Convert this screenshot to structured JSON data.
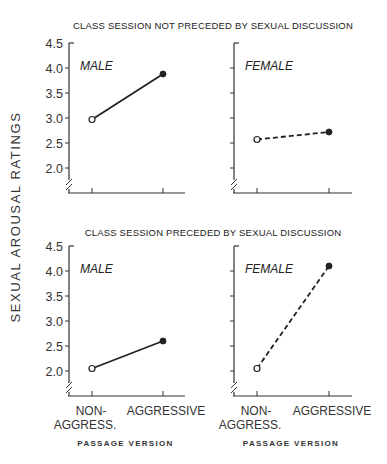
{
  "chart_data": [
    {
      "type": "line",
      "title": "CLASS SESSION NOT PRECEDED BY SEXUAL DISCUSSION",
      "panel": "MALE",
      "categories": [
        "NON-AGGRESS.",
        "AGGRESSIVE"
      ],
      "values": [
        2.97,
        3.88
      ],
      "line_style": "solid",
      "ylim": [
        2.0,
        4.5
      ],
      "yticks": [
        "4.5",
        "4.0",
        "3.5",
        "3.0",
        "2.5",
        "2.0"
      ],
      "xlabel": "",
      "ylabel": "SEXUAL AROUSAL RATINGS"
    },
    {
      "type": "line",
      "title": "CLASS SESSION NOT PRECEDED BY SEXUAL DISCUSSION",
      "panel": "FEMALE",
      "categories": [
        "NON-AGGRESS.",
        "AGGRESSIVE"
      ],
      "values": [
        2.57,
        2.72
      ],
      "line_style": "dashed",
      "ylim": [
        2.0,
        4.5
      ],
      "xlabel": "",
      "ylabel": "SEXUAL AROUSAL RATINGS"
    },
    {
      "type": "line",
      "title": "CLASS SESSION PRECEDED BY SEXUAL DISCUSSION",
      "panel": "MALE",
      "categories": [
        "NON-AGGRESS.",
        "AGGRESSIVE"
      ],
      "values": [
        2.05,
        2.6
      ],
      "line_style": "solid",
      "ylim": [
        2.0,
        4.5
      ],
      "yticks": [
        "4.5",
        "4.0",
        "3.5",
        "3.0",
        "2.5",
        "2.0"
      ],
      "xlabel": "PASSAGE VERSION",
      "ylabel": "SEXUAL AROUSAL RATINGS"
    },
    {
      "type": "line",
      "title": "CLASS SESSION PRECEDED BY SEXUAL DISCUSSION",
      "panel": "FEMALE",
      "categories": [
        "NON-AGGRESS.",
        "AGGRESSIVE"
      ],
      "values": [
        2.05,
        4.1
      ],
      "line_style": "dashed",
      "ylim": [
        2.0,
        4.5
      ],
      "xlabel": "PASSAGE VERSION",
      "ylabel": "SEXUAL AROUSAL RATINGS"
    }
  ],
  "figure": {
    "top_title": "CLASS SESSION NOT PRECEDED BY SEXUAL DISCUSSION",
    "bottom_title": "CLASS SESSION PRECEDED BY SEXUAL DISCUSSION",
    "ylabel": "SEXUAL AROUSAL RATINGS",
    "xlabel": "PASSAGE VERSION",
    "x_cat_1_line1": "NON-",
    "x_cat_1_line2": "AGGRESS.",
    "x_cat_2": "AGGRESSIVE",
    "male_label": "MALE",
    "female_label": "FEMALE",
    "yticks": [
      "4.5",
      "4.0",
      "3.5",
      "3.0",
      "2.5",
      "2.0"
    ]
  }
}
